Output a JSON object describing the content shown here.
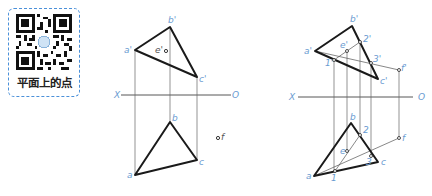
{
  "qr_card": {
    "label": "平面上的点",
    "border_color": "#4a90d9"
  },
  "left_figure": {
    "axis": {
      "left_label": "X",
      "right_label": "O"
    },
    "front_view": {
      "a": "a'",
      "b": "b'",
      "c": "c'",
      "e": "e'"
    },
    "top_view": {
      "a": "a",
      "b": "b",
      "c": "c",
      "f": "f"
    }
  },
  "right_figure": {
    "axis": {
      "left_label": "X",
      "right_label": "O"
    },
    "front_view": {
      "a": "a'",
      "b": "b'",
      "c": "c'",
      "e": "e'",
      "f": "f'",
      "p1": "1'",
      "p2": "2'",
      "p3": "3'"
    },
    "top_view": {
      "a": "a",
      "b": "b",
      "c": "c",
      "e": "e",
      "f": "f",
      "p1": "1",
      "p2": "2",
      "p3": "3"
    }
  },
  "colors": {
    "label_blue": "#6a9bd1",
    "line_dark": "#1a1a1a",
    "line_thin": "#444444"
  }
}
